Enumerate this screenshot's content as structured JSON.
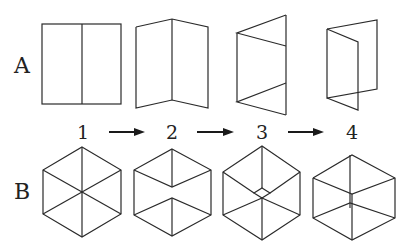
{
  "rows": [
    {
      "label": "A",
      "description": "Folding a rectangular sheet along its center line"
    },
    {
      "label": "B",
      "description": "Hexagon with diagonals transforming into a wireframe cube (Necker cube)"
    }
  ],
  "steps": [
    "1",
    "2",
    "3",
    "4"
  ],
  "arrows": [
    "1→2",
    "2→3",
    "3→4"
  ],
  "colors": {
    "line": "#2a2a2a",
    "background": "#ffffff"
  }
}
